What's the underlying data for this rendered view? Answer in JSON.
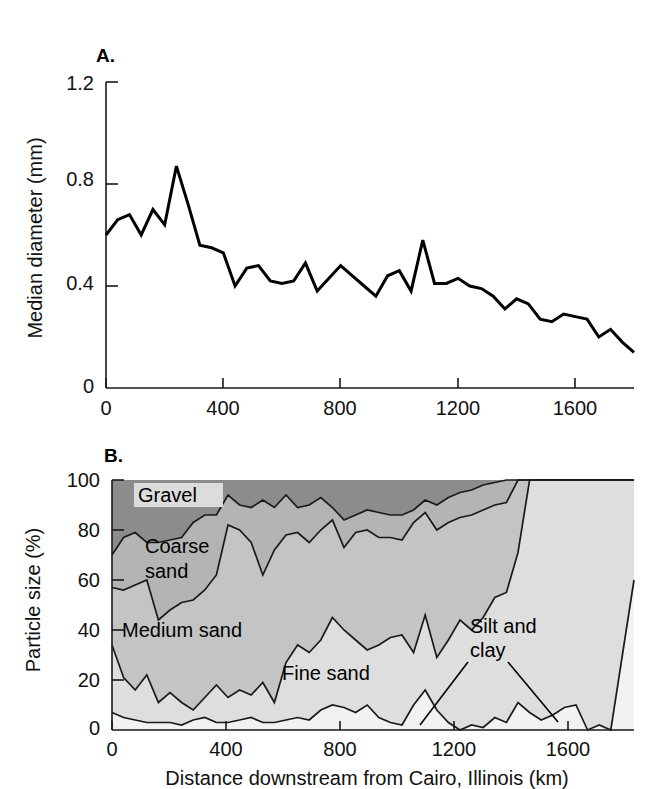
{
  "figure": {
    "panel_a_letter": "A.",
    "panel_b_letter": "B.",
    "shared_xlabel": "Distance downstream from Cairo, Illinois (km)"
  },
  "chart_data": [
    {
      "id": "panel-a",
      "type": "line",
      "title": "A.",
      "xlabel": "Distance downstream from Cairo, Illinois (km)",
      "ylabel": "Median diameter (mm)",
      "xlim": [
        0,
        1800
      ],
      "ylim": [
        0,
        1.2
      ],
      "xticks": [
        0,
        400,
        800,
        1200,
        1600
      ],
      "xtick_labels": [
        "0",
        "400",
        "800",
        "1200",
        "1600"
      ],
      "yticks": [
        0,
        0.4,
        0.8,
        1.2
      ],
      "ytick_labels": [
        "0",
        "0.4",
        "0.8",
        "1.2"
      ],
      "grid": false,
      "legend": "none",
      "x": [
        0,
        40,
        80,
        120,
        160,
        200,
        240,
        280,
        320,
        360,
        400,
        440,
        480,
        520,
        560,
        600,
        640,
        680,
        720,
        760,
        800,
        840,
        880,
        920,
        960,
        1000,
        1040,
        1080,
        1120,
        1160,
        1200,
        1240,
        1280,
        1320,
        1360,
        1400,
        1440,
        1480,
        1520,
        1560,
        1600,
        1640,
        1680,
        1720,
        1760,
        1800
      ],
      "values": [
        0.6,
        0.66,
        0.68,
        0.6,
        0.7,
        0.64,
        0.87,
        0.72,
        0.56,
        0.55,
        0.53,
        0.4,
        0.47,
        0.48,
        0.42,
        0.41,
        0.42,
        0.49,
        0.38,
        0.43,
        0.48,
        0.44,
        0.4,
        0.36,
        0.44,
        0.46,
        0.38,
        0.58,
        0.41,
        0.41,
        0.43,
        0.4,
        0.39,
        0.36,
        0.31,
        0.35,
        0.33,
        0.27,
        0.26,
        0.29,
        0.28,
        0.27,
        0.2,
        0.23,
        0.18,
        0.14
      ]
    },
    {
      "id": "panel-b",
      "type": "area",
      "title": "B.",
      "xlabel": "Distance downstream from Cairo, Illinois (km)",
      "ylabel": "Particle size (%)",
      "xlim": [
        0,
        1800
      ],
      "ylim": [
        0,
        100
      ],
      "xticks": [
        0,
        400,
        800,
        1200,
        1600
      ],
      "xtick_labels": [
        "0",
        "400",
        "800",
        "1200",
        "1600"
      ],
      "yticks": [
        0,
        20,
        40,
        60,
        80,
        100
      ],
      "ytick_labels": [
        "0",
        "20",
        "40",
        "60",
        "80",
        "100"
      ],
      "grid": false,
      "legend": "in-plot-annotations",
      "stacked": true,
      "x": [
        0,
        40,
        80,
        120,
        160,
        200,
        240,
        280,
        320,
        360,
        400,
        440,
        480,
        520,
        560,
        600,
        640,
        680,
        720,
        760,
        800,
        840,
        880,
        920,
        960,
        1000,
        1040,
        1080,
        1120,
        1160,
        1200,
        1240,
        1280,
        1320,
        1360,
        1400,
        1440,
        1480,
        1520,
        1560,
        1600,
        1640,
        1680,
        1720,
        1760,
        1800
      ],
      "cumulative_series": [
        {
          "name": "Silt and clay cumulative top",
          "values": [
            7,
            5,
            4,
            3,
            3,
            3,
            2,
            4,
            5,
            3,
            3,
            4,
            5,
            3,
            3,
            4,
            5,
            4,
            8,
            10,
            9,
            7,
            10,
            5,
            3,
            2,
            10,
            16,
            8,
            3,
            0,
            2,
            1,
            5,
            3,
            11,
            7,
            4,
            6,
            9,
            10,
            0,
            2,
            0,
            30,
            60
          ]
        },
        {
          "name": "Fine sand cumulative top",
          "values": [
            34,
            21,
            16,
            22,
            11,
            15,
            11,
            8,
            13,
            18,
            13,
            16,
            14,
            19,
            11,
            27,
            34,
            31,
            36,
            45,
            40,
            36,
            32,
            34,
            37,
            38,
            31,
            46,
            29,
            36,
            44,
            40,
            45,
            53,
            55,
            71,
            100,
            100,
            100,
            100,
            100,
            100,
            100,
            100,
            100,
            100
          ]
        },
        {
          "name": "Medium sand cumulative top",
          "values": [
            57,
            56,
            58,
            60,
            44,
            48,
            51,
            52,
            56,
            62,
            82,
            80,
            75,
            62,
            72,
            78,
            79,
            75,
            80,
            84,
            73,
            79,
            80,
            77,
            77,
            76,
            83,
            87,
            80,
            83,
            85,
            86,
            88,
            90,
            91,
            100,
            100,
            100,
            100,
            100,
            100,
            100,
            100,
            100,
            100,
            100
          ]
        },
        {
          "name": "Coarse sand cumulative top",
          "values": [
            70,
            77,
            79,
            75,
            75,
            76,
            77,
            83,
            86,
            86,
            94,
            90,
            89,
            92,
            89,
            94,
            89,
            90,
            93,
            89,
            84,
            86,
            88,
            87,
            86,
            86,
            88,
            92,
            90,
            93,
            95,
            96,
            98,
            99,
            100,
            100,
            100,
            100,
            100,
            100,
            100,
            100,
            100,
            100,
            100,
            100
          ]
        },
        {
          "name": "Gravel cumulative top",
          "values": [
            100,
            100,
            100,
            100,
            100,
            100,
            100,
            100,
            100,
            100,
            100,
            100,
            100,
            100,
            100,
            100,
            100,
            100,
            100,
            100,
            100,
            100,
            100,
            100,
            100,
            100,
            100,
            100,
            100,
            100,
            100,
            100,
            100,
            100,
            100,
            100,
            100,
            100,
            100,
            100,
            100,
            100,
            100,
            100,
            100,
            100
          ]
        }
      ],
      "annotations": [
        {
          "text": "Gravel",
          "boxed": true
        },
        {
          "text": "Coarse",
          "boxed": false
        },
        {
          "text": "sand",
          "boxed": false
        },
        {
          "text": "Medium sand",
          "boxed": false
        },
        {
          "text": "Fine sand",
          "boxed": false
        },
        {
          "text": "Silt and",
          "boxed": false
        },
        {
          "text": "clay",
          "boxed": false
        }
      ],
      "colors": {
        "gravel": "#8c8c8c",
        "coarse_sand": "#b4b4b4",
        "medium_sand": "#c4c4c4",
        "fine_sand": "#dedede",
        "silt_and_clay": "#f2f2f2"
      }
    }
  ],
  "panel_a": {
    "letter": "A.",
    "ylabel": "Median diameter (mm)",
    "ytick_labels": [
      "1.2",
      "0.8",
      "0.4",
      "0"
    ],
    "xtick_labels": [
      "0",
      "400",
      "800",
      "1200",
      "1600"
    ]
  },
  "panel_b": {
    "letter": "B.",
    "ylabel": "Particle size (%)",
    "ytick_labels": [
      "100",
      "80",
      "60",
      "40",
      "20",
      "0"
    ],
    "xtick_labels": [
      "0",
      "400",
      "800",
      "1200",
      "1600"
    ],
    "xlabel": "Distance downstream from Cairo, Illinois (km)",
    "labels": {
      "gravel": "Gravel",
      "coarse_sand_l1": "Coarse",
      "coarse_sand_l2": "sand",
      "medium_sand": "Medium sand",
      "fine_sand": "Fine sand",
      "silt_and_clay_l1": "Silt and",
      "silt_and_clay_l2": "clay"
    }
  }
}
